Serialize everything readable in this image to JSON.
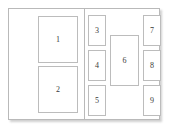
{
  "window": {
    "title": "Layout Regions",
    "background_color": "#ffffff",
    "frame_border_color": "#b9b9b9",
    "box_border_color": "#bcbcbc",
    "label_color": "#3a3a3a"
  },
  "panels": {
    "left": {
      "name": "left-panel",
      "boxes": [
        {
          "id": "box-1",
          "label": "1"
        },
        {
          "id": "box-2",
          "label": "2"
        }
      ]
    },
    "right": {
      "name": "right-panel",
      "columns": {
        "left_column": [
          {
            "id": "box-3",
            "label": "3"
          },
          {
            "id": "box-4",
            "label": "4"
          },
          {
            "id": "box-5",
            "label": "5"
          }
        ],
        "center_column": [
          {
            "id": "box-6",
            "label": "6"
          }
        ],
        "right_column": [
          {
            "id": "box-7",
            "label": "7"
          },
          {
            "id": "box-8",
            "label": "8"
          },
          {
            "id": "box-9",
            "label": "9"
          }
        ]
      }
    }
  }
}
